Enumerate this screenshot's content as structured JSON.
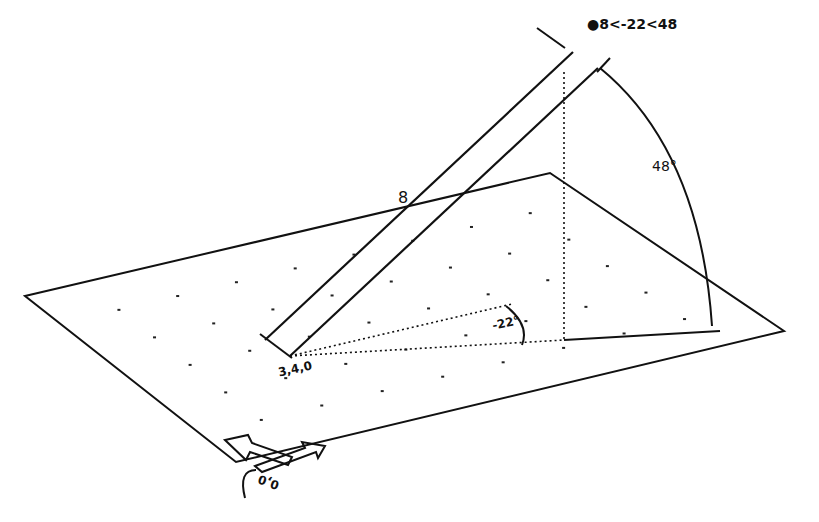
{
  "diagram": {
    "coordinate_label": "@8<-22<48",
    "coordinate_symbol": "●",
    "coordinate_text": "8<-22<48",
    "distance_label": "8",
    "xy_angle_label": "-22°",
    "z_angle_label": "48°",
    "base_point_label": "3,4,0",
    "ucs_origin_label": "0,0",
    "line_color": "#111111",
    "background": "#ffffff"
  }
}
